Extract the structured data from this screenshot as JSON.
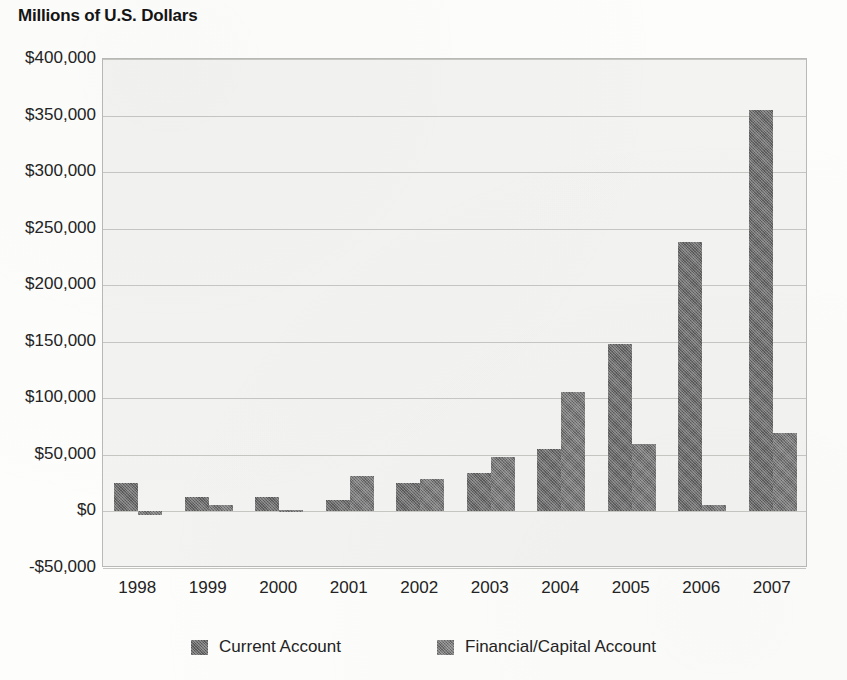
{
  "chart_data": {
    "type": "bar",
    "title": "Millions of U.S. Dollars",
    "subtitle": "",
    "xlabel": "",
    "ylabel": "",
    "categories": [
      "1998",
      "1999",
      "2000",
      "2001",
      "2002",
      "2003",
      "2004",
      "2005",
      "2006",
      "2007"
    ],
    "series": [
      {
        "name": "Current Account",
        "values": [
          25000,
          13000,
          13000,
          10000,
          25000,
          34000,
          55000,
          148000,
          238000,
          355000
        ]
      },
      {
        "name": "Financial/Capital Account",
        "values": [
          -3000,
          6000,
          1000,
          31000,
          29000,
          48000,
          106000,
          60000,
          6000,
          69000
        ]
      }
    ],
    "ylim": [
      -50000,
      400000
    ],
    "ytick_values": [
      400000,
      350000,
      300000,
      250000,
      200000,
      150000,
      100000,
      50000,
      0,
      -50000
    ],
    "ytick_labels": [
      "$400,000",
      "$350,000",
      "$300,000",
      "$250,000",
      "$200,000",
      "$150,000",
      "$100,000",
      "$50,000",
      "$0",
      "-$50,000"
    ],
    "grid": true,
    "legend_position": "bottom",
    "colors": {
      "current_account": "#6b6b6b",
      "financial_capital_account": "#777777",
      "plot_background": "#f3f3f1",
      "gridline": "#c6c6c2",
      "axis_text": "#232323"
    }
  },
  "legend": {
    "entries": [
      {
        "label": "Current Account",
        "swatch_class": "current",
        "icon": "legend-swatch-icon"
      },
      {
        "label": "Financial/Capital Account",
        "swatch_class": "financial",
        "icon": "legend-swatch-icon"
      }
    ]
  }
}
